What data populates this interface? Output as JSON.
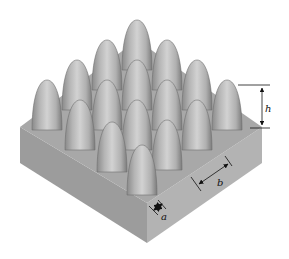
{
  "figure": {
    "grid": {
      "rows": 4,
      "cols": 4
    },
    "labels": {
      "height": "h",
      "pitch": "b",
      "gap": "a"
    },
    "colors": {
      "background": "#ffffff",
      "top_face": "#a9a9a9",
      "left_face": "#999999",
      "right_face": "#b4b4b4",
      "bump_light": "#d6d6d6",
      "bump_mid": "#b2b2b2",
      "bump_dark": "#7a7a7a",
      "dimension_lines": "#111111"
    }
  }
}
